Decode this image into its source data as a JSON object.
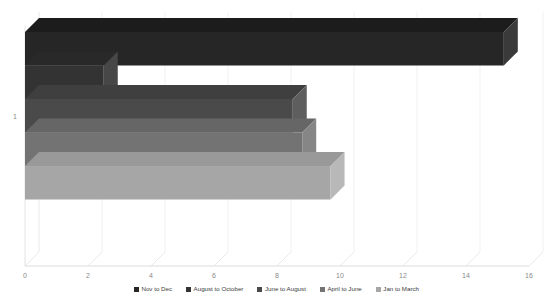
{
  "cropped_header_text": "",
  "chart_data": {
    "type": "bar",
    "orientation": "horizontal",
    "style": "3d-clustered-bar",
    "title": "",
    "xlabel": "",
    "ylabel": "",
    "categories": [
      "1"
    ],
    "xlim": [
      0,
      16
    ],
    "xticks": [
      "0",
      "2",
      "4",
      "6",
      "8",
      "10",
      "12",
      "14",
      "16"
    ],
    "xtick_values": [
      0,
      2,
      4,
      6,
      8,
      10,
      12,
      14,
      16
    ],
    "yticks": [
      "1"
    ],
    "grid": true,
    "legend_position": "bottom",
    "series": [
      {
        "name": "Nov to Dec",
        "values": [
          15.2
        ],
        "color": "#262626",
        "side": "#3a3a3a",
        "top": "#1c1c1c"
      },
      {
        "name": "August to October",
        "values": [
          2.5
        ],
        "color": "#333333",
        "side": "#474747",
        "top": "#292929"
      },
      {
        "name": "June to August",
        "values": [
          8.5
        ],
        "color": "#4a4a4a",
        "side": "#5e5e5e",
        "top": "#3f3f3f"
      },
      {
        "name": "April to June",
        "values": [
          8.8
        ],
        "color": "#737373",
        "side": "#868686",
        "top": "#666666"
      },
      {
        "name": "Jan to March",
        "values": [
          9.7
        ],
        "color": "#a6a6a6",
        "side": "#b8b8b8",
        "top": "#999999"
      }
    ]
  },
  "legend": {
    "items": [
      {
        "label": "Nov to Dec"
      },
      {
        "label": "August to October"
      },
      {
        "label": "June to August"
      },
      {
        "label": "April to June"
      },
      {
        "label": "Jan to March"
      }
    ]
  },
  "axis": {
    "x_tick_labels": [
      "0",
      "2",
      "4",
      "6",
      "8",
      "10",
      "12",
      "14",
      "16"
    ],
    "y_tick_labels": [
      "1"
    ]
  }
}
